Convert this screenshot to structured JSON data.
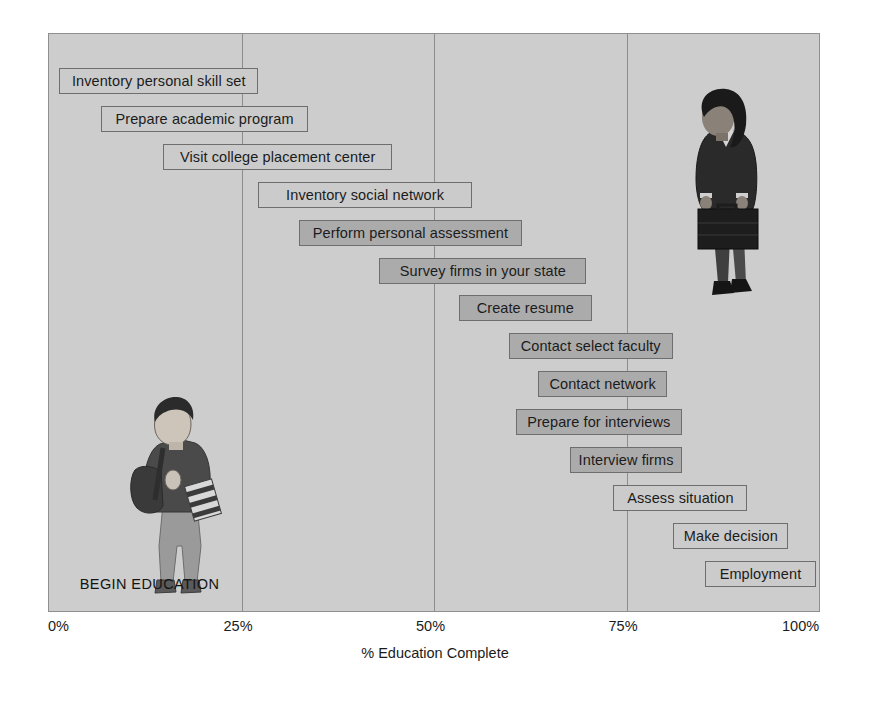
{
  "chart_data": {
    "type": "bar",
    "title": "",
    "subtitle": "",
    "xlabel": "% Education Complete",
    "ylabel": "",
    "xlim": [
      0,
      100
    ],
    "x_tick_labels": [
      "0%",
      "25%",
      "50%",
      "75%",
      "100%"
    ],
    "x_tick_values": [
      0,
      25,
      50,
      75,
      100
    ],
    "gridlines": [
      25,
      50,
      75
    ],
    "grid": true,
    "legend": "none",
    "orientation": "horizontal",
    "categories": [
      "Inventory personal skill set",
      "Prepare academic program",
      "Visit college placement center",
      "Inventory social network",
      "Perform personal assessment",
      "Survey firms in your state",
      "Create resume",
      "Contact select faculty",
      "Contact network",
      "Prepare for interviews",
      "Interview firms",
      "Assess situation",
      "Make decision",
      "Employment"
    ],
    "bars": [
      {
        "label": "Inventory personal skill set",
        "start": 1.3,
        "end": 27.2,
        "shade": "light"
      },
      {
        "label": "Prepare academic program",
        "start": 6.7,
        "end": 33.7,
        "shade": "light"
      },
      {
        "label": "Visit college placement center",
        "start": 14.8,
        "end": 44.6,
        "shade": "light"
      },
      {
        "label": "Inventory social network",
        "start": 27.2,
        "end": 54.9,
        "shade": "light"
      },
      {
        "label": "Perform personal assessment",
        "start": 32.5,
        "end": 61.4,
        "shade": "dark"
      },
      {
        "label": "Survey firms in your state",
        "start": 42.9,
        "end": 69.8,
        "shade": "dark"
      },
      {
        "label": "Create resume",
        "start": 53.2,
        "end": 70.5,
        "shade": "dark"
      },
      {
        "label": "Contact select faculty",
        "start": 59.7,
        "end": 81.0,
        "shade": "dark"
      },
      {
        "label": "Contact network",
        "start": 63.5,
        "end": 80.3,
        "shade": "dark"
      },
      {
        "label": "Prepare for interviews",
        "start": 60.6,
        "end": 82.2,
        "shade": "dark"
      },
      {
        "label": "Interview firms",
        "start": 67.7,
        "end": 82.2,
        "shade": "dark"
      },
      {
        "label": "Assess situation",
        "start": 73.3,
        "end": 90.7,
        "shade": "light"
      },
      {
        "label": "Make decision",
        "start": 81.1,
        "end": 96.0,
        "shade": "light"
      },
      {
        "label": "Employment",
        "start": 85.2,
        "end": 99.6,
        "shade": "light"
      }
    ],
    "annotations": [
      {
        "text": "BEGIN EDUCATION",
        "x": 4,
        "y": 94
      }
    ],
    "colors": {
      "plot_background": "#cdcdcd",
      "bar_light": "#cbcbcb",
      "bar_dark": "#ababab",
      "bar_border": "#6e6e6e",
      "gridline": "#8d8d8d",
      "text": "#1b1b1b"
    },
    "images": [
      {
        "name": "student-figure",
        "description": "student with backpack and books",
        "x": 17,
        "y": 68
      },
      {
        "name": "professional-figure",
        "description": "businesswoman with briefcase",
        "x": 86,
        "y": 20
      }
    ]
  },
  "axis": {
    "title": "% Education Complete",
    "ticks": [
      {
        "label": "0%",
        "value": 0
      },
      {
        "label": "25%",
        "value": 25
      },
      {
        "label": "50%",
        "value": 50
      },
      {
        "label": "75%",
        "value": 75
      },
      {
        "label": "100%",
        "value": 100
      }
    ]
  },
  "annotation": {
    "begin_education": "BEGIN EDUCATION"
  }
}
